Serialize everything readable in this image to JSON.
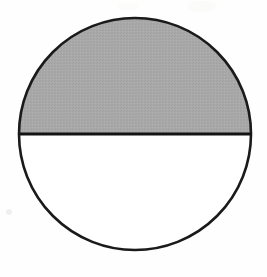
{
  "figure": {
    "shape_type": "circle",
    "shaded_portion": "upper-half",
    "shaded_fraction": "1/2",
    "background_color": "#fefefe",
    "circle": {
      "center_x": 135,
      "center_y": 134,
      "radius": 116,
      "stroke_color": "#1a1a1a",
      "stroke_width": 2.6,
      "unshaded_fill": "#ffffff"
    },
    "upper_region": {
      "label": "shaded-semicircle",
      "fill_color": "#a8a8a8",
      "fill_texture": "halftone-gray"
    },
    "lower_region": {
      "label": "unshaded-semicircle",
      "fill_color": "#ffffff"
    },
    "diameter_line": {
      "label": "horizontal-diameter",
      "y": 134,
      "x_start": 20,
      "x_end": 251,
      "stroke_color": "#141414",
      "stroke_width": 3
    }
  }
}
